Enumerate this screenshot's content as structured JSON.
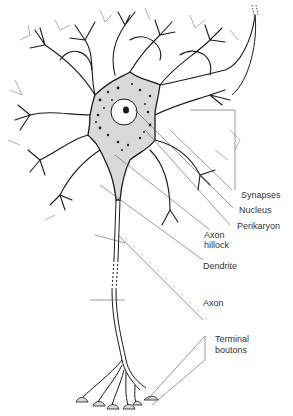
{
  "diagram": {
    "colors": {
      "line": "#1a1a1a",
      "leader": "#555555",
      "soma_fill": "#d9d9d9",
      "label": "#333333"
    },
    "labels": {
      "synapses": "Synapses",
      "nucleus": "Nucleus",
      "perikaryon": "Perikaryon",
      "axon_hillock_1": "Axon",
      "axon_hillock_2": "hillock",
      "dendrite": "Dendrite",
      "axon": "Axon",
      "terminal_boutons_1": "Terminal",
      "terminal_boutons_2": "boutons"
    }
  }
}
